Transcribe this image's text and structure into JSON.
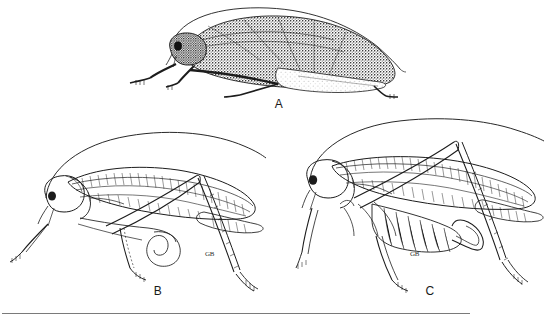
{
  "figure": {
    "kind": "scientific-illustration-plate",
    "background_color": "#ffffff",
    "ink_color": "#1c1c1c",
    "rule_color": "#7a7a7a",
    "panels": [
      {
        "id": "A",
        "label": "A",
        "style": "stippled-shaded",
        "description": "Lateral view of a broad-winged katydid with heavily stippled dark tegmina, long filamentous antenna arching over the body, forelegs and midlegs extended, hind femur concealed.",
        "sex": "male",
        "antenna": "single long arching filament extending beyond wing apex",
        "ovipositor_present": false,
        "shading": "dense stipple"
      },
      {
        "id": "B",
        "label": "B",
        "style": "line-outline",
        "description": "Lateral view of a katydid in pure outline with visible wing venation reticulation, long arching antenna, raised hind leg with femur and tibia forming an inverted V, spined tibia and tarsus.",
        "sex": "male",
        "antenna": "single long arching filament sweeping up and to the right",
        "ovipositor_present": false,
        "shading": "outline only, venation hatching"
      },
      {
        "id": "C",
        "label": "C",
        "style": "line-outline",
        "description": "Lateral view of a female katydid in outline with banded abdomen, upcurved sickle-shaped ovipositor, long arching antenna, raised hind leg with spined tibia, reticulate wing venation.",
        "sex": "female",
        "antenna": "single long arching filament sweeping up and to the right",
        "ovipositor_present": true,
        "ovipositor_shape": "short, stout, strongly upcurved sickle",
        "shading": "outline only, venation hatching"
      }
    ],
    "artist_monograms": [
      {
        "text": "GB",
        "near_panel": "B"
      },
      {
        "text": "GB",
        "near_panel": "C"
      }
    ],
    "bottom_rule": {
      "present": true
    }
  }
}
